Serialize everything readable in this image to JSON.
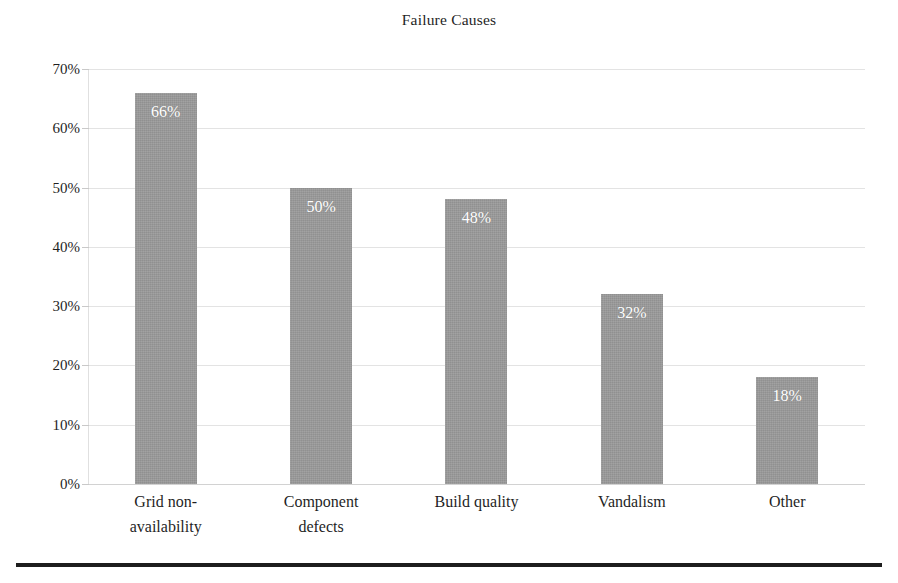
{
  "chart_data": {
    "type": "bar",
    "title": "Failure Causes",
    "xlabel": "",
    "ylabel": "",
    "categories": [
      "Grid non-availability",
      "Component defects",
      "Build quality",
      "Vandalism",
      "Other"
    ],
    "category_lines": [
      [
        "Grid non-",
        "availability"
      ],
      [
        "Component",
        "defects"
      ],
      [
        "Build quality"
      ],
      [
        "Vandalism"
      ],
      [
        "Other"
      ]
    ],
    "values": [
      66,
      50,
      48,
      32,
      18
    ],
    "value_labels": [
      "66%",
      "50%",
      "48%",
      "32%",
      "18%"
    ],
    "ylim": [
      0,
      70
    ],
    "ytick_values": [
      0,
      10,
      20,
      30,
      40,
      50,
      60,
      70
    ],
    "ytick_labels": [
      "0%",
      "10%",
      "20%",
      "30%",
      "40%",
      "50%",
      "60%",
      "70%"
    ],
    "grid": true,
    "legend": false,
    "legend_position": "none",
    "bar_color": "#9a9a9a",
    "value_label_color": "#ffffff",
    "gridline_color": "#e3e3e3",
    "text_color": "#1f1f1f",
    "background_color": "#ffffff",
    "bottom_rule_color": "#1d1d1d"
  }
}
